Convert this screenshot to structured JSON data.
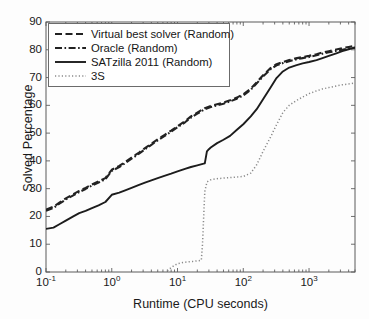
{
  "chart_data": {
    "type": "line",
    "title": "",
    "xlabel": "Runtime (CPU seconds)",
    "ylabel": "Solved Percentage",
    "xscale": "log",
    "xlim": [
      0.1,
      5000
    ],
    "ylim": [
      0,
      90
    ],
    "grid": false,
    "legend_position": "upper left",
    "xticks": [
      {
        "value": 0.1,
        "mantissa": "10",
        "exponent": "-1"
      },
      {
        "value": 1,
        "mantissa": "10",
        "exponent": "0"
      },
      {
        "value": 10,
        "mantissa": "10",
        "exponent": "1"
      },
      {
        "value": 100,
        "mantissa": "10",
        "exponent": "2"
      },
      {
        "value": 1000,
        "mantissa": "10",
        "exponent": "3"
      }
    ],
    "yticks": [
      0,
      10,
      20,
      30,
      40,
      50,
      60,
      70,
      80,
      90
    ],
    "series": [
      {
        "name": "Virtual best solver (Random)",
        "style": "dashed",
        "color": "#222222",
        "x": [
          0.1,
          0.13,
          0.16,
          0.2,
          0.26,
          0.32,
          0.4,
          0.5,
          0.63,
          0.8,
          1.0,
          1.3,
          1.6,
          2.0,
          2.6,
          3.2,
          4.0,
          5.0,
          6.3,
          8.0,
          10,
          13,
          16,
          20,
          26,
          32,
          40,
          50,
          63,
          80,
          100,
          130,
          160,
          200,
          260,
          320,
          400,
          500,
          630,
          800,
          1000,
          1300,
          1600,
          2000,
          2600,
          3200,
          4000,
          5000
        ],
        "y": [
          22.5,
          23.5,
          25.0,
          26.5,
          28.0,
          29.2,
          30.3,
          31.5,
          32.6,
          33.8,
          36.8,
          38.2,
          39.6,
          41.2,
          43.0,
          44.6,
          46.2,
          47.8,
          49.3,
          50.9,
          52.5,
          54.3,
          56.0,
          57.4,
          59.0,
          59.8,
          60.4,
          61.0,
          61.8,
          62.8,
          64.0,
          66.0,
          68.3,
          70.8,
          73.4,
          74.8,
          75.6,
          76.3,
          76.9,
          77.4,
          77.8,
          78.4,
          79.0,
          79.5,
          80.1,
          80.6,
          81.0,
          81.4
        ]
      },
      {
        "name": "Oracle (Random)",
        "style": "dashdot",
        "color": "#222222",
        "x": [
          0.1,
          0.13,
          0.16,
          0.2,
          0.26,
          0.32,
          0.4,
          0.5,
          0.63,
          0.8,
          1.0,
          1.3,
          1.6,
          2.0,
          2.6,
          3.2,
          4.0,
          5.0,
          6.3,
          8.0,
          10,
          13,
          16,
          20,
          26,
          32,
          40,
          50,
          63,
          80,
          100,
          130,
          160,
          200,
          260,
          320,
          400,
          500,
          630,
          800,
          1000,
          1300,
          1600,
          2000,
          2600,
          3200,
          4000,
          5000
        ],
        "y": [
          22.0,
          23.1,
          24.6,
          26.1,
          27.6,
          28.8,
          29.9,
          31.1,
          32.2,
          33.4,
          36.4,
          37.8,
          39.2,
          40.8,
          42.6,
          44.2,
          45.8,
          47.4,
          48.9,
          50.5,
          52.1,
          53.9,
          55.6,
          57.0,
          58.6,
          59.4,
          60.0,
          60.6,
          61.4,
          62.4,
          63.6,
          65.6,
          67.9,
          70.4,
          73.0,
          74.4,
          75.2,
          75.9,
          76.5,
          77.0,
          77.4,
          78.0,
          78.6,
          79.1,
          79.6,
          80.0,
          80.4,
          80.8
        ]
      },
      {
        "name": "SATzilla 2011 (Random)",
        "style": "solid",
        "color": "#1c1c1c",
        "x": [
          0.1,
          0.13,
          0.16,
          0.2,
          0.26,
          0.32,
          0.4,
          0.5,
          0.63,
          0.8,
          1.0,
          1.3,
          1.6,
          2.0,
          2.6,
          3.2,
          4.0,
          5.0,
          6.3,
          8.0,
          10,
          13,
          16,
          20,
          25,
          26,
          28,
          30,
          32,
          40,
          50,
          63,
          80,
          100,
          130,
          160,
          200,
          260,
          320,
          400,
          500,
          630,
          800,
          1000,
          1300,
          1600,
          2000,
          2600,
          3200,
          4000,
          5000
        ],
        "y": [
          15.5,
          16.0,
          17.2,
          18.5,
          20.0,
          21.2,
          22.0,
          23.0,
          24.0,
          25.2,
          27.8,
          28.6,
          29.4,
          30.3,
          31.4,
          32.2,
          33.0,
          33.8,
          34.6,
          35.4,
          36.2,
          37.1,
          37.8,
          38.4,
          39.0,
          39.1,
          43.4,
          44.2,
          44.8,
          46.4,
          47.6,
          49.0,
          51.2,
          53.2,
          56.0,
          58.6,
          62.2,
          66.4,
          69.8,
          72.2,
          73.6,
          74.4,
          75.1,
          75.6,
          76.3,
          77.0,
          77.8,
          78.7,
          79.5,
          80.2,
          80.8
        ]
      },
      {
        "name": "3S",
        "style": "dotted",
        "color": "#8a8a8a",
        "x": [
          7.0,
          8.0,
          9.0,
          10,
          12,
          14,
          17,
          20,
          23,
          24,
          25,
          26,
          28,
          32,
          40,
          50,
          63,
          80,
          100,
          130,
          160,
          200,
          260,
          320,
          400,
          500,
          630,
          800,
          1000,
          1300,
          1600,
          2000,
          2600,
          3200,
          4000,
          5000
        ],
        "y": [
          0.4,
          1.6,
          2.4,
          3.0,
          3.4,
          3.6,
          3.8,
          4.0,
          4.2,
          10.0,
          20.0,
          29.0,
          32.4,
          33.2,
          33.6,
          33.8,
          34.0,
          34.2,
          34.4,
          35.6,
          38.6,
          43.4,
          48.6,
          53.0,
          57.4,
          60.0,
          61.6,
          63.0,
          64.2,
          65.2,
          65.9,
          66.4,
          67.0,
          67.4,
          67.7,
          68.0
        ]
      }
    ]
  },
  "legend": {
    "items": [
      {
        "label": "Virtual best solver (Random)",
        "style": "dashed"
      },
      {
        "label": "Oracle (Random)",
        "style": "dashdot"
      },
      {
        "label": "SATzilla 2011 (Random)",
        "style": "solid"
      },
      {
        "label": "3S",
        "style": "dotted"
      }
    ]
  },
  "axes": {
    "y_label": "Solved Percentage",
    "x_label": "Runtime (CPU seconds)"
  }
}
